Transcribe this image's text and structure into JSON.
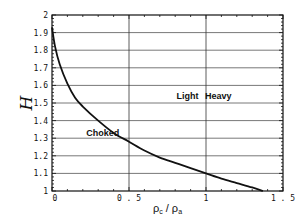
{
  "chart_data": {
    "type": "line",
    "title": "",
    "xlabel": "ρc / ρa",
    "ylabel": "H",
    "xlim": [
      0,
      1.5
    ],
    "ylim": [
      1,
      2
    ],
    "xticks": [
      0,
      0.5,
      1,
      1.5
    ],
    "xtick_labels": [
      "0",
      "0.5",
      "1",
      "1.5"
    ],
    "yticks": [
      1,
      1.1,
      1.2,
      1.3,
      1.4,
      1.5,
      1.6,
      1.7,
      1.8,
      1.9,
      2
    ],
    "ytick_labels": [
      "1",
      "1.1",
      "1.2",
      "1.3",
      "1.4",
      "1.5",
      "1.6",
      "1.7",
      "1.8",
      "1.9",
      "2"
    ],
    "grid": {
      "horizontal": true,
      "vertical_at": [
        0.5,
        1.0
      ]
    },
    "legend": null,
    "series": [
      {
        "name": "H vs density ratio",
        "x": [
          0.0,
          0.02,
          0.05,
          0.1,
          0.15,
          0.2,
          0.3,
          0.4,
          0.5,
          0.6,
          0.7,
          0.8,
          0.9,
          1.0,
          1.1,
          1.2,
          1.3,
          1.37
        ],
        "y": [
          1.93,
          1.82,
          1.72,
          1.61,
          1.53,
          1.48,
          1.4,
          1.33,
          1.28,
          1.23,
          1.19,
          1.16,
          1.13,
          1.1,
          1.07,
          1.045,
          1.02,
          1.0
        ]
      }
    ],
    "annotations": [
      {
        "text": "Choked",
        "x": 0.33,
        "y": 1.31
      },
      {
        "text": "Light",
        "x": 0.88,
        "y": 1.52
      },
      {
        "text": "Heavy",
        "x": 1.08,
        "y": 1.52
      }
    ]
  },
  "labels": {
    "ylabel": "H",
    "xlabel_main1": "ρ",
    "xlabel_sub1": "c",
    "xlabel_sep": " / ρ",
    "xlabel_sub2": "a",
    "choked": "Choked",
    "light": "Light",
    "heavy": "Heavy"
  }
}
